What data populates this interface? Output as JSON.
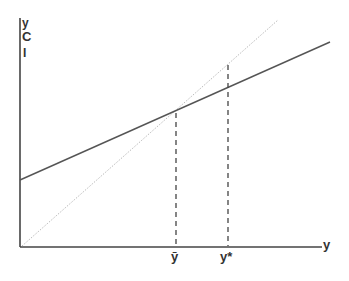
{
  "diagram": {
    "type": "keynesian-cross",
    "y_axis_labels": [
      "y",
      "C",
      "I"
    ],
    "x_axis_label": "y",
    "tick_labels": [
      {
        "name": "y-bar",
        "text": "ȳ",
        "x": 176
      },
      {
        "name": "y-star",
        "text": "y*",
        "x": 228
      }
    ],
    "lines": {
      "aggregate_demand": {
        "style": "solid",
        "color": "#555555",
        "from": [
          20,
          180
        ],
        "to": [
          330,
          42
        ]
      },
      "forty_five_degree": {
        "style": "dotted",
        "color": "#bbbbbb",
        "from": [
          22,
          246
        ],
        "to": [
          278,
          20
        ]
      }
    },
    "dashed_guides": [
      {
        "name": "y-bar-guide",
        "x": 176,
        "from_y": 113,
        "to_y": 246
      },
      {
        "name": "y-star-guide",
        "x": 228,
        "from_y": 65,
        "to_y": 246
      }
    ],
    "colors": {
      "axis": "#444444",
      "text": "#333333"
    }
  }
}
